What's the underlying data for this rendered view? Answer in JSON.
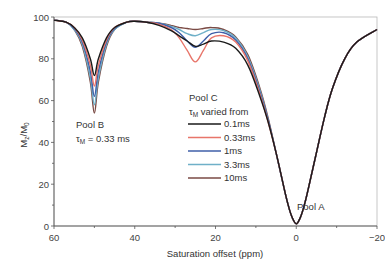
{
  "chart_data": {
    "type": "line",
    "title": "",
    "xlabel": "Saturation offset (ppm)",
    "ylabel": "Mz/M0",
    "xlim": [
      60,
      -20
    ],
    "ylim": [
      0,
      100
    ],
    "x_ticks": [
      "60",
      "40",
      "20",
      "0",
      "-20"
    ],
    "y_ticks": [
      "0",
      "20",
      "40",
      "60",
      "80",
      "100"
    ],
    "grid": false,
    "legend": {
      "title_line1": "Pool C",
      "title_line2_symbol": "τ",
      "title_line2_sub": "M",
      "title_line2_rest": " varied from",
      "position": "center-left"
    },
    "annotations": {
      "pool_a": "Pool A",
      "pool_b_line1": "Pool B",
      "pool_b_symbol": "τ",
      "pool_b_sub": "M",
      "pool_b_rest": " = 0.33 ms",
      "ylabel_main": "M",
      "ylabel_sub1": "z",
      "ylabel_slash": "/M",
      "ylabel_sub2": "0"
    },
    "x": [
      60,
      57,
      55,
      53,
      51,
      50,
      49,
      47,
      45,
      42,
      40,
      37,
      34,
      31,
      29,
      27,
      25,
      23,
      21,
      18,
      15,
      12,
      9,
      7,
      5,
      3,
      2,
      1,
      0,
      -1,
      -2,
      -3,
      -5,
      -7,
      -9,
      -12,
      -15,
      -20
    ],
    "series": [
      {
        "name": "0.1ms",
        "color": "#1a1a1a",
        "values": [
          98.5,
          97.5,
          95,
          90,
          80,
          72,
          80,
          90,
          95,
          97.5,
          98,
          97.5,
          96,
          93.5,
          91,
          88.5,
          86,
          87,
          88.5,
          88,
          85,
          77,
          62,
          50,
          35,
          18,
          10,
          4,
          1,
          4,
          10,
          18,
          35,
          52,
          66,
          80,
          88,
          94
        ]
      },
      {
        "name": "0.33ms",
        "color": "#e8756a",
        "values": [
          98.5,
          97.5,
          95,
          89,
          77,
          67,
          77,
          89,
          95,
          97.5,
          98,
          97.5,
          96.5,
          94,
          90,
          84,
          78.5,
          84,
          90,
          91,
          88,
          79,
          63,
          50,
          35,
          18,
          10,
          4,
          1,
          4,
          10,
          18,
          35,
          52,
          66,
          80,
          88,
          94
        ]
      },
      {
        "name": "1ms",
        "color": "#3f5fa8",
        "values": [
          98.5,
          97.5,
          94.5,
          88,
          74,
          62,
          74,
          88,
          94.5,
          97.5,
          98,
          97.5,
          97,
          95,
          92.5,
          88.5,
          85.5,
          88.5,
          92,
          92.5,
          89,
          80,
          64,
          51,
          35,
          18,
          10,
          4,
          1,
          4,
          10,
          18,
          35,
          52,
          66,
          80,
          88,
          94
        ]
      },
      {
        "name": "3.3ms",
        "color": "#6fb0c8",
        "values": [
          98.5,
          97.5,
          94,
          87,
          71,
          58,
          71,
          87,
          94,
          97.5,
          98,
          97.5,
          97,
          95.5,
          94,
          92,
          91,
          92.5,
          94,
          93.5,
          90,
          81,
          65,
          51,
          35,
          18,
          10,
          4,
          1,
          4,
          10,
          18,
          35,
          52,
          66,
          80,
          88,
          94
        ]
      },
      {
        "name": "10ms",
        "color": "#7a4a44",
        "values": [
          98.5,
          97.5,
          94,
          86,
          69,
          54,
          69,
          86,
          94,
          97.5,
          98,
          97.5,
          97,
          96,
          95,
          94.5,
          94,
          94.5,
          95,
          94,
          90.5,
          82,
          66,
          52,
          35,
          18,
          10,
          4,
          1,
          4,
          10,
          18,
          35,
          52,
          66,
          80,
          88,
          94
        ]
      }
    ]
  }
}
